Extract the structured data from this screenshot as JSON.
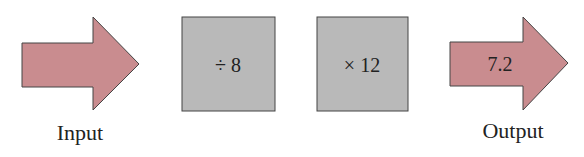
{
  "input": {
    "label": "Input",
    "value": ""
  },
  "steps": [
    {
      "operation": "÷ 8"
    },
    {
      "operation": "× 12"
    }
  ],
  "output": {
    "label": "Output",
    "value": "7.2"
  },
  "colors": {
    "arrow_fill": "#c98c8f",
    "box_fill": "#b9b9b9",
    "stroke": "#444444"
  }
}
